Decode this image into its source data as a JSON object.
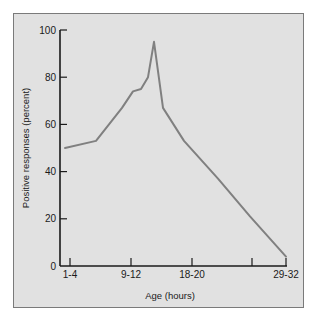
{
  "chart_data": {
    "type": "line",
    "title": "",
    "xlabel": "Age (hours)",
    "ylabel": "Positive responses (percent)",
    "ylim": [
      0,
      100
    ],
    "yticks": [
      0,
      20,
      40,
      60,
      80,
      100
    ],
    "xtick_labels": [
      "1-4",
      "",
      "9-12",
      "18-20",
      "",
      "29-32"
    ],
    "labeled_xticks": [
      {
        "label": "1-4",
        "px": 70
      },
      {
        "label": "9-12",
        "px": 131
      },
      {
        "label": "18-20",
        "px": 192
      },
      {
        "label": "",
        "px": 252
      },
      {
        "label": "29-32",
        "px": 286
      }
    ],
    "grid": false,
    "legend": null,
    "series": [
      {
        "name": "Positive responses",
        "color": "#808080",
        "points": [
          {
            "x_px": 65,
            "y": 50
          },
          {
            "x_px": 96,
            "y": 53
          },
          {
            "x_px": 122,
            "y": 67
          },
          {
            "x_px": 133,
            "y": 74
          },
          {
            "x_px": 141,
            "y": 75
          },
          {
            "x_px": 148,
            "y": 80
          },
          {
            "x_px": 154,
            "y": 95
          },
          {
            "x_px": 163,
            "y": 67
          },
          {
            "x_px": 184,
            "y": 53
          },
          {
            "x_px": 218,
            "y": 37
          },
          {
            "x_px": 250,
            "y": 21
          },
          {
            "x_px": 286,
            "y": 4
          }
        ]
      }
    ]
  },
  "axes": {
    "x_title": "Age (hours)",
    "y_title": "Positive responses (percent)"
  },
  "colors": {
    "panel_background": "#e1e1e1",
    "panel_border": "#7a7a7a",
    "axis": "#1a1a1a",
    "line": "#808080"
  }
}
